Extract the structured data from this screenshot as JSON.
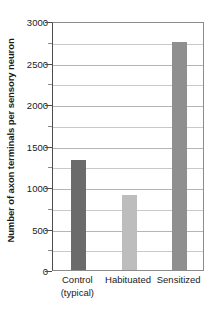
{
  "chart_data": {
    "type": "bar",
    "title": "",
    "xlabel": "",
    "ylabel": "Number of axon terminals per sensory neuron",
    "categories": [
      "Control (typical)",
      "Habituated",
      "Sensitized"
    ],
    "category_lines": [
      [
        "Control",
        "(typical)"
      ],
      [
        "Habituated",
        ""
      ],
      [
        "Sensitized",
        ""
      ]
    ],
    "values": [
      1330,
      900,
      2750
    ],
    "bar_colors": [
      "#6b6b6b",
      "#bdbdbd",
      "#8f8f8f"
    ],
    "ylim": [
      0,
      3000
    ],
    "ytick_major": [
      0,
      500,
      1000,
      1500,
      2000,
      2500,
      3000
    ],
    "ytick_major_labels": [
      "0",
      "500",
      "1000",
      "1500",
      "2000",
      "2500",
      "3000"
    ],
    "ytick_minor": [
      250,
      750,
      1250,
      1750,
      2250,
      2750
    ],
    "gridlines": [
      250,
      500,
      750,
      1000,
      1250,
      1500,
      1750,
      2000,
      2250,
      2500,
      2750
    ],
    "grid": true,
    "legend": "none",
    "legend_position": "none"
  },
  "figure": {
    "background_color": "#ffffff",
    "axis_color": "#4d4d4d",
    "grid_color": "#c9c9c9",
    "text_color": "#1a1a1a"
  }
}
